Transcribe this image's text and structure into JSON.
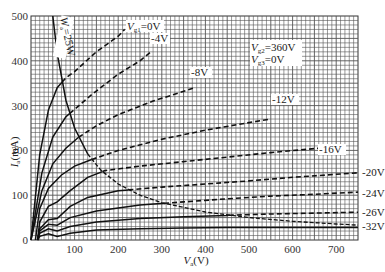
{
  "chart_data": {
    "type": "line",
    "title": "",
    "xlabel": "Va (V)",
    "ylabel": "Ia (mA)",
    "xlim": [
      0,
      750
    ],
    "ylim": [
      0,
      500
    ],
    "x_ticks": [
      100,
      200,
      300,
      400,
      500,
      600,
      700
    ],
    "y_ticks": [
      0,
      100,
      200,
      300,
      400,
      500
    ],
    "grid": true,
    "grid_minor_step": {
      "x": 10,
      "y": 10
    },
    "conditions": [
      "Vg2=360V",
      "Vg3=0V"
    ],
    "power_limit": {
      "label": "Wa=25W",
      "watts": 25,
      "style": "solid-then-dashed hyperbola",
      "points": [
        [
          50,
          500
        ],
        [
          60,
          417
        ],
        [
          80,
          312
        ],
        [
          100,
          250
        ],
        [
          130,
          192
        ],
        [
          160,
          156
        ],
        [
          200,
          125
        ],
        [
          250,
          100
        ],
        [
          300,
          83
        ],
        [
          400,
          62.5
        ],
        [
          500,
          50
        ],
        [
          600,
          41.7
        ],
        [
          700,
          35.7
        ],
        [
          750,
          33.3
        ]
      ]
    },
    "series": [
      {
        "name": "Vg1=0V",
        "label": "Vg1=0V",
        "points": [
          [
            0,
            0
          ],
          [
            20,
            190
          ],
          [
            40,
            290
          ],
          [
            60,
            340
          ],
          [
            80,
            362
          ],
          [
            100,
            376
          ],
          [
            150,
            420
          ],
          [
            200,
            455
          ],
          [
            215,
            470
          ]
        ]
      },
      {
        "name": "-4V",
        "label": "-4V",
        "points": [
          [
            0,
            0
          ],
          [
            25,
            150
          ],
          [
            50,
            230
          ],
          [
            80,
            275
          ],
          [
            110,
            300
          ],
          [
            140,
            325
          ],
          [
            200,
            370
          ],
          [
            250,
            400
          ],
          [
            275,
            420
          ]
        ]
      },
      {
        "name": "-8V",
        "label": "-8V",
        "points": [
          [
            0,
            0
          ],
          [
            25,
            110
          ],
          [
            50,
            170
          ],
          [
            80,
            205
          ],
          [
            110,
            230
          ],
          [
            150,
            255
          ],
          [
            200,
            280
          ],
          [
            280,
            310
          ],
          [
            360,
            335
          ],
          [
            375,
            340
          ]
        ]
      },
      {
        "name": "-12V",
        "label": "-12V",
        "points": [
          [
            10,
            0
          ],
          [
            20,
            70
          ],
          [
            40,
            115
          ],
          [
            70,
            145
          ],
          [
            100,
            165
          ],
          [
            140,
            180
          ],
          [
            200,
            200
          ],
          [
            300,
            225
          ],
          [
            400,
            245
          ],
          [
            500,
            262
          ],
          [
            550,
            270
          ]
        ]
      },
      {
        "name": "-16V",
        "label": "-16V",
        "points": [
          [
            15,
            0
          ],
          [
            20,
            40
          ],
          [
            40,
            75
          ],
          [
            60,
            85
          ],
          [
            90,
            110
          ],
          [
            130,
            140
          ],
          [
            170,
            155
          ],
          [
            250,
            165
          ],
          [
            350,
            175
          ],
          [
            450,
            185
          ],
          [
            550,
            195
          ],
          [
            660,
            205
          ]
        ]
      },
      {
        "name": "-20V",
        "label": "-20V",
        "points": [
          [
            15,
            0
          ],
          [
            20,
            25
          ],
          [
            40,
            45
          ],
          [
            60,
            48
          ],
          [
            90,
            75
          ],
          [
            130,
            95
          ],
          [
            200,
            110
          ],
          [
            300,
            118
          ],
          [
            400,
            125
          ],
          [
            500,
            132
          ],
          [
            600,
            140
          ],
          [
            750,
            150
          ]
        ]
      },
      {
        "name": "-24V",
        "label": "-24V",
        "points": [
          [
            15,
            0
          ],
          [
            20,
            20
          ],
          [
            40,
            35
          ],
          [
            60,
            33
          ],
          [
            90,
            50
          ],
          [
            150,
            65
          ],
          [
            250,
            78
          ],
          [
            350,
            85
          ],
          [
            450,
            92
          ],
          [
            550,
            98
          ],
          [
            650,
            102
          ],
          [
            750,
            107
          ]
        ]
      },
      {
        "name": "-26V",
        "label": "-26V",
        "points": [
          [
            15,
            0
          ],
          [
            20,
            15
          ],
          [
            40,
            25
          ],
          [
            60,
            20
          ],
          [
            90,
            30
          ],
          [
            150,
            40
          ],
          [
            250,
            48
          ],
          [
            350,
            52
          ],
          [
            450,
            55
          ],
          [
            550,
            58
          ],
          [
            650,
            60
          ],
          [
            750,
            62
          ]
        ]
      },
      {
        "name": "-32V",
        "label": "-32V",
        "points": [
          [
            15,
            0
          ],
          [
            20,
            8
          ],
          [
            40,
            14
          ],
          [
            60,
            8
          ],
          [
            90,
            15
          ],
          [
            150,
            22
          ],
          [
            250,
            25
          ],
          [
            350,
            27
          ],
          [
            450,
            28
          ],
          [
            550,
            28
          ],
          [
            650,
            28
          ],
          [
            750,
            28
          ]
        ]
      }
    ]
  },
  "labels": {
    "y_axis_main": "I",
    "y_axis_sub": "a",
    "y_axis_unit": "(mA)",
    "x_axis_main": "V",
    "x_axis_sub": "a",
    "x_axis_unit": "(V)",
    "cond1_main": "V",
    "cond1_sub": "g2",
    "cond1_val": "=360V",
    "cond2_main": "V",
    "cond2_sub": "g3",
    "cond2_val": "=0V",
    "power_main": "W",
    "power_sub": "a",
    "power_val": "=25W",
    "curve0_main": "V",
    "curve0_sub": "g1",
    "curve0_val": "=0V",
    "curve1": "-4V",
    "curve2": "-8V",
    "curve3": "-12V",
    "curve4": "-16V",
    "curve5": "-20V",
    "curve6": "-24V",
    "curve7": "-26V",
    "curve8": "-32V"
  },
  "colors": {
    "grid": "#555555",
    "curve": "#111111",
    "background": "#ffffff",
    "text": "#222222"
  }
}
